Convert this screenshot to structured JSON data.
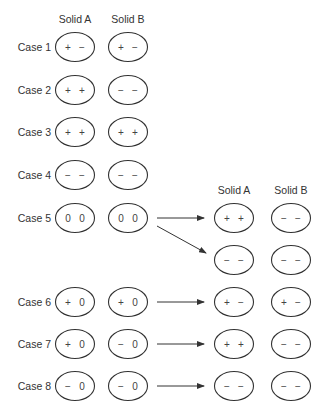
{
  "left_headers": {
    "solid_a": "Solid A",
    "solid_b": "Solid B"
  },
  "right_headers": {
    "solid_a": "Solid A",
    "solid_b": "Solid B"
  },
  "cases": [
    {
      "label": "Case 1",
      "a": [
        "+",
        "−"
      ],
      "b": [
        "+",
        "−"
      ]
    },
    {
      "label": "Case 2",
      "a": [
        "+",
        "+"
      ],
      "b": [
        "−",
        "−"
      ]
    },
    {
      "label": "Case 3",
      "a": [
        "+",
        "+"
      ],
      "b": [
        "+",
        "+"
      ]
    },
    {
      "label": "Case 4",
      "a": [
        "−",
        "−"
      ],
      "b": [
        "−",
        "−"
      ]
    },
    {
      "label": "Case 5",
      "a": [
        "0",
        "0"
      ],
      "b": [
        "0",
        "0"
      ],
      "results": [
        {
          "a": [
            "+",
            "+"
          ],
          "b": [
            "−",
            "−"
          ]
        },
        {
          "a": [
            "−",
            "−"
          ],
          "b": [
            "−",
            "−"
          ]
        }
      ]
    },
    {
      "label": "Case 6",
      "a": [
        "+",
        "0"
      ],
      "b": [
        "+",
        "0"
      ],
      "results": [
        {
          "a": [
            "+",
            "−"
          ],
          "b": [
            "+",
            "−"
          ]
        }
      ]
    },
    {
      "label": "Case 7",
      "a": [
        "+",
        "0"
      ],
      "b": [
        "−",
        "0"
      ],
      "results": [
        {
          "a": [
            "+",
            "+"
          ],
          "b": [
            "−",
            "−"
          ]
        }
      ]
    },
    {
      "label": "Case 8",
      "a": [
        "−",
        "0"
      ],
      "b": [
        "−",
        "0"
      ],
      "results": [
        {
          "a": [
            "−",
            "−"
          ],
          "b": [
            "−",
            "−"
          ]
        }
      ]
    }
  ]
}
